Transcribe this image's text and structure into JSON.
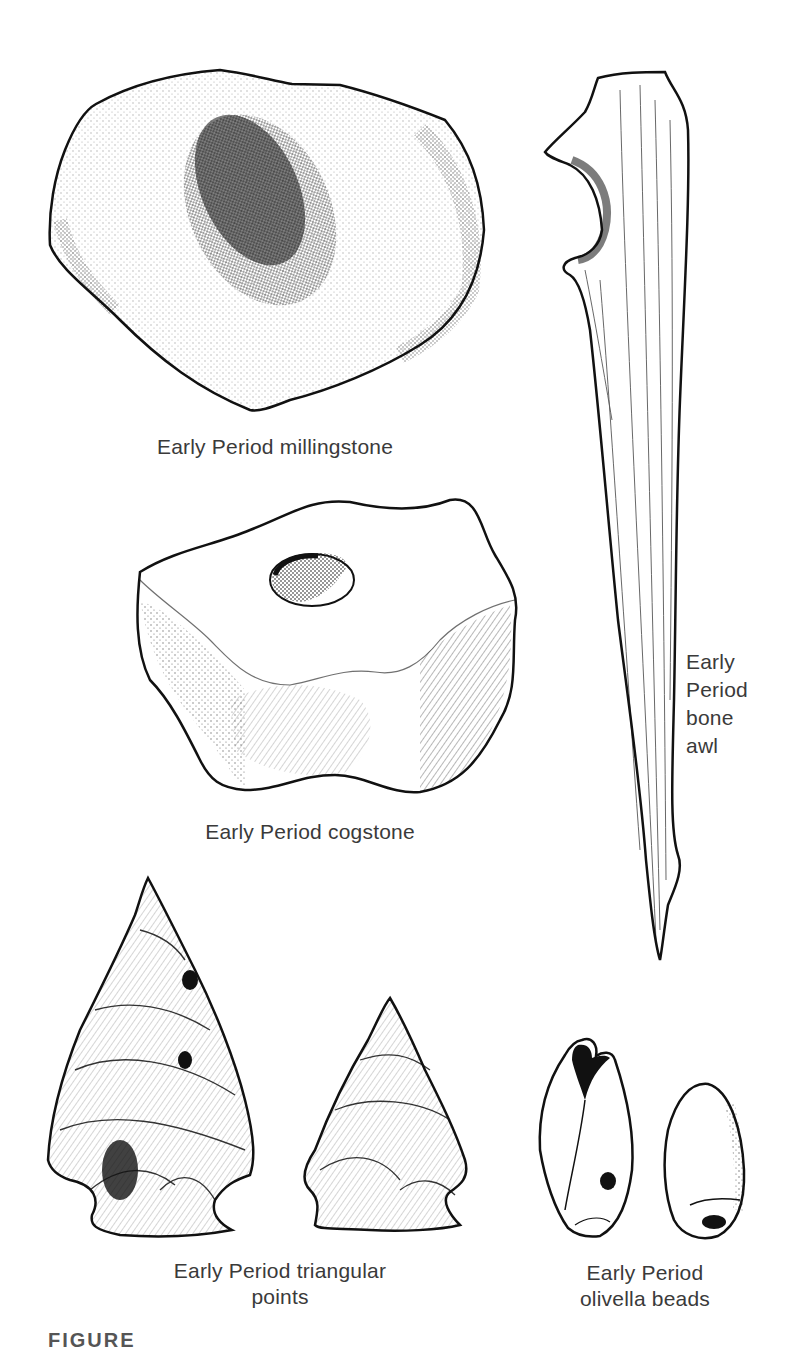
{
  "figure": {
    "label_partial": "FIGURE",
    "artifacts": [
      {
        "id": "millingstone",
        "caption_lines": [
          "Early Period millingstone"
        ]
      },
      {
        "id": "bone-awl",
        "caption_lines": [
          "Early",
          "Period",
          "bone",
          "awl"
        ]
      },
      {
        "id": "cogstone",
        "caption_lines": [
          "Early Period cogstone"
        ]
      },
      {
        "id": "triangular-points",
        "caption_lines": [
          "Early Period triangular",
          "points"
        ]
      },
      {
        "id": "olivella-beads",
        "caption_lines": [
          "Early Period",
          "olivella beads"
        ]
      }
    ]
  },
  "colors": {
    "ink": "#111111",
    "caption": "#3a3a3a",
    "paper": "#ffffff"
  }
}
